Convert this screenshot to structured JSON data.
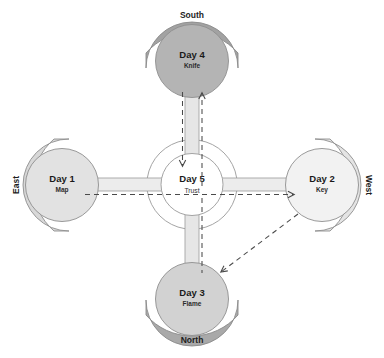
{
  "diagram": {
    "type": "radial-hub-and-spoke",
    "center": {
      "title": "Day 5",
      "subtitle": "Trust",
      "fill": "#ffffff",
      "stroke": "#9a9a9a"
    },
    "nodes": [
      {
        "id": "day1",
        "title": "Day 1",
        "subtitle": "Map",
        "direction_label": "East",
        "position": "left",
        "circle_fill": "#e2e2e2",
        "arc_fill": "#d8d8d8"
      },
      {
        "id": "day2",
        "title": "Day 2",
        "subtitle": "Key",
        "direction_label": "West",
        "position": "right",
        "circle_fill": "#f2f2f2",
        "arc_fill": "#e4e4e4"
      },
      {
        "id": "day3",
        "title": "Day 3",
        "subtitle": "Flame",
        "direction_label": "North",
        "position": "bottom",
        "circle_fill": "#d2d2d2",
        "arc_fill": "#a9a9a9"
      },
      {
        "id": "day4",
        "title": "Day 4",
        "subtitle": "Knife",
        "direction_label": "South",
        "position": "top",
        "circle_fill": "#b4b4b4",
        "arc_fill": "#a2a2a2"
      }
    ],
    "spokes": [
      {
        "id": "spoke-left",
        "from": "center",
        "to": "day1",
        "fill": "#ececec"
      },
      {
        "id": "spoke-right",
        "from": "center",
        "to": "day2",
        "fill": "#ececec"
      },
      {
        "id": "spoke-bottom",
        "from": "center",
        "to": "day3",
        "fill": "#e6e6e6"
      },
      {
        "id": "spoke-top",
        "from": "center",
        "to": "day4",
        "fill": "#e6e6e6"
      }
    ],
    "flow_arrows": [
      {
        "id": "arrow-up-to-day4",
        "style": "dashed",
        "head": "up",
        "color": "#4a4a4a"
      },
      {
        "id": "arrow-down-to-center",
        "style": "dashed",
        "head": "down",
        "color": "#4a4a4a"
      },
      {
        "id": "arrow-right-to-day2",
        "style": "dashed",
        "head": "right",
        "color": "#4a4a4a"
      },
      {
        "id": "arrow-day2-to-day3",
        "style": "dashed",
        "head": "down-left",
        "color": "#4a4a4a"
      },
      {
        "id": "arrow-vert-down-day3",
        "style": "dashed",
        "head": "none",
        "color": "#4a4a4a"
      }
    ],
    "colors": {
      "background": "#ffffff",
      "outline": "#8f8f8f",
      "dark_arc": "#a2a2a2",
      "light_arc": "#d8d8d8",
      "dash": "#4a4a4a"
    }
  }
}
